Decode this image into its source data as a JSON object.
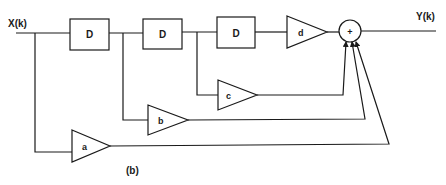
{
  "diagram": {
    "type": "FIR filter block diagram",
    "input_label": "X(k)",
    "output_label": "Y(k)",
    "caption": "(b)",
    "delays": [
      {
        "label": "D"
      },
      {
        "label": "D"
      },
      {
        "label": "D"
      }
    ],
    "gains": [
      {
        "label": "a"
      },
      {
        "label": "b"
      },
      {
        "label": "c"
      },
      {
        "label": "d"
      }
    ],
    "summer": {
      "label": "+"
    },
    "colors": {
      "stroke": "#1a1a1a",
      "background": "#ffffff"
    }
  }
}
